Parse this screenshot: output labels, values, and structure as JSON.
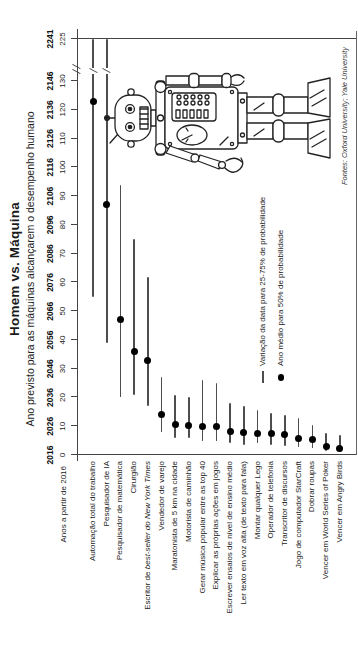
{
  "page": {
    "background": "#ffffff",
    "orientation": "chart rotated 90deg CCW into portrait"
  },
  "chart_data": {
    "type": "scatter",
    "variant": "range-dot (dumbbell) columns: 25-75% probability interval with median dot",
    "title": "Homem vs. Máquina",
    "subtitle": "Ano previsto para as máquinas alcançarem o desempenho humano",
    "source": "Fontes: Oxford University; Yale University",
    "xlabel": "Anos a partir de 2016",
    "x_axis": {
      "title": "Anos a partir de 2016",
      "year_ticks": [
        "2016",
        "2026",
        "2036",
        "2046",
        "2056",
        "2066",
        "2076",
        "2086",
        "2096",
        "2106",
        "2116",
        "2126",
        "2136",
        "2146",
        "2241"
      ],
      "offset_ticks": [
        "0",
        "10",
        "20",
        "30",
        "40",
        "50",
        "60",
        "70",
        "80",
        "90",
        "100",
        "110",
        "120",
        "130",
        "225"
      ],
      "linear_range": [
        0,
        130
      ],
      "axis_break_after": 130,
      "value_after_break": 225,
      "grid": "off",
      "frame": "rectangle with top axis, tick marks above axis"
    },
    "legend": [
      {
        "symbol": "range-line",
        "label": "Variação da data para 25-75% de probabilidade"
      },
      {
        "symbol": "median-dot",
        "label": "Ano médio para 50% de probabilidade"
      }
    ],
    "legend_position": "bottom-right, left of robot illustration",
    "tasks": [
      {
        "label": "Automação total do trabalho",
        "p25": 55,
        "median": 123,
        "p75": 225,
        "beyond_break": true
      },
      {
        "label": "Pesquisador de IA",
        "p25": 39,
        "median": 87,
        "p75": 225,
        "beyond_break": true
      },
      {
        "label": "Pesquisador de matemática",
        "p25": 20,
        "median": 47,
        "p75": 94
      },
      {
        "label": "Cirurgião",
        "p25": 21,
        "median": 36,
        "p75": 75
      },
      {
        "label_prefix": "Escritor de ",
        "label_italic": "best-seller do New York Times",
        "p25": 17,
        "median": 33,
        "p75": 62
      },
      {
        "label": "Vendedor de varejo",
        "p25": 8,
        "median": 14,
        "p75": 27
      },
      {
        "label": "Maratonista de 5 km na cidade",
        "p25": 6,
        "median": 10.5,
        "p75": 21
      },
      {
        "label": "Motorista de caminhão",
        "p25": 6,
        "median": 10.2,
        "p75": 20
      },
      {
        "label": "Gerar música popular entre as top 40",
        "p25": 5,
        "median": 10,
        "p75": 26
      },
      {
        "label": "Explicar as próprias ações em jogos",
        "p25": 5,
        "median": 9.8,
        "p75": 25
      },
      {
        "label": "Escrever ensaios de nível de ensino médio",
        "p25": 4,
        "median": 8.2,
        "p75": 18
      },
      {
        "label": "Ler texto em voz alta (de texto para fala)",
        "p25": 3.5,
        "median": 7.8,
        "p75": 17
      },
      {
        "label": "Montar qualquer Lego",
        "p25": 4,
        "median": 7.5,
        "p75": 15.5
      },
      {
        "label": "Operador de telefonia",
        "p25": 3.5,
        "median": 7.3,
        "p75": 14.5
      },
      {
        "label": "Transcritor de discursos",
        "p25": 3,
        "median": 7,
        "p75": 14
      },
      {
        "label": "Jogo de computador StarCraft",
        "p25": 2.7,
        "median": 5.8,
        "p75": 13
      },
      {
        "label": "Dobrar roupas",
        "p25": 2.3,
        "median": 5.4,
        "p75": 10.5
      },
      {
        "label": "Vencer em World Series of Poker",
        "p25": 1.5,
        "median": 2.9,
        "p75": 7.5
      },
      {
        "label": "Vencer em Angry Birds",
        "p25": 1.2,
        "median": 2.4,
        "p75": 7
      }
    ],
    "robot_illustration": "toy tin robot standing at right side of plot",
    "colors": {
      "background": "#ffffff",
      "range_line": "#4d4d4d",
      "median_dot": "#000000",
      "frame": "#444444",
      "text": "#1a1a1a",
      "robot_stroke": "#222222"
    }
  }
}
